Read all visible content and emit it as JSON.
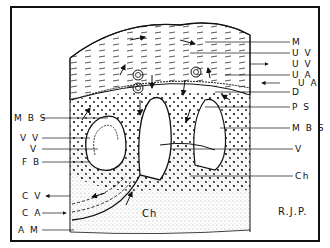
{
  "diagram": {
    "type": "anatomical cross-section (placenta)",
    "signature": "R.J.P.",
    "inner_label_ch": "Ch",
    "labels_right": [
      {
        "id": "m",
        "text": "M",
        "y": 42
      },
      {
        "id": "uv1",
        "text": "U V",
        "y": 53
      },
      {
        "id": "uv2",
        "text": "U V",
        "y": 64
      },
      {
        "id": "ua1",
        "text": "U A",
        "y": 75
      },
      {
        "id": "ua2",
        "text": "U A",
        "y": 83
      },
      {
        "id": "d",
        "text": "D",
        "y": 92
      },
      {
        "id": "ps",
        "text": "P S",
        "y": 107
      },
      {
        "id": "mbs_r",
        "text": "M B S",
        "y": 128
      },
      {
        "id": "v_r",
        "text": "V",
        "y": 149
      },
      {
        "id": "ch_r",
        "text": "Ch",
        "y": 176
      }
    ],
    "labels_left": [
      {
        "id": "mbs_l",
        "text": "M B S",
        "y": 118
      },
      {
        "id": "vv",
        "text": "V V",
        "y": 138
      },
      {
        "id": "v_l",
        "text": "V",
        "y": 149
      },
      {
        "id": "fb",
        "text": "F B",
        "y": 162
      },
      {
        "id": "cv",
        "text": "C V",
        "y": 196
      },
      {
        "id": "ca",
        "text": "C A",
        "y": 213
      },
      {
        "id": "am",
        "text": "A M",
        "y": 230
      }
    ],
    "colors": {
      "ink": "#111111",
      "paper": "#ffffff"
    }
  }
}
